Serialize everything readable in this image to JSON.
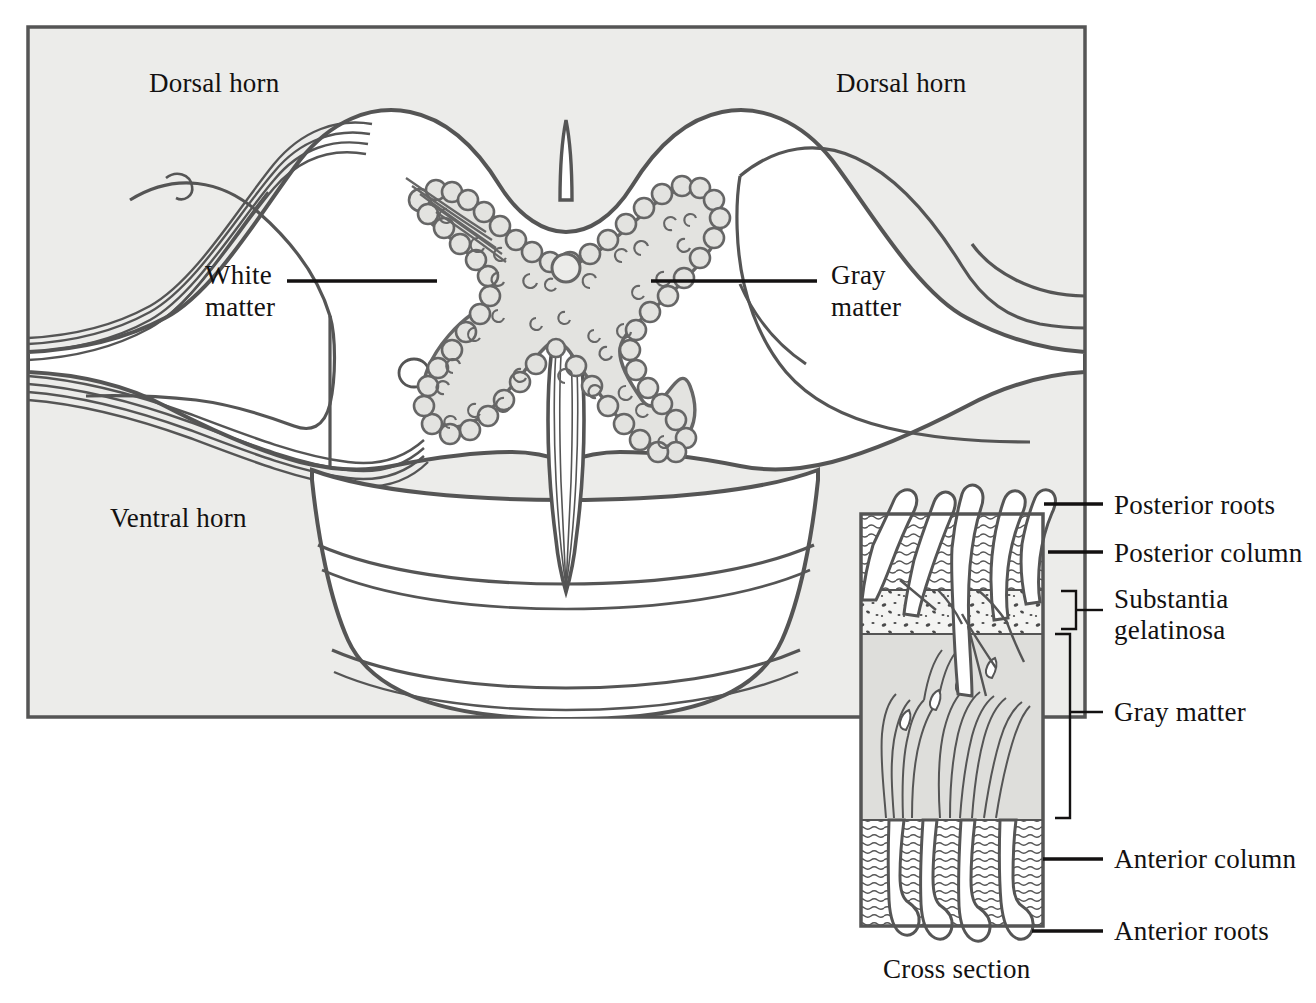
{
  "figure": {
    "kind": "anatomical-diagram",
    "background_color": "#ffffff",
    "panel_fill": "#ececea",
    "gray_matter_fill": "#e3e3e0",
    "ink_color": "#4a4a4a",
    "text_color": "#131111"
  },
  "main_panel": {
    "labels": {
      "dorsal_horn_left": "Dorsal horn",
      "dorsal_horn_right": "Dorsal horn",
      "white_matter_line1": "White",
      "white_matter_line2": "matter",
      "gray_matter_line1": "Gray",
      "gray_matter_line2": "matter",
      "ventral_horn": "Ventral horn"
    }
  },
  "inset": {
    "caption": "Cross section",
    "labels": [
      {
        "id": "posterior-roots",
        "text": "Posterior roots",
        "connector": "line"
      },
      {
        "id": "posterior-column",
        "text": "Posterior column",
        "connector": "line"
      },
      {
        "id": "substantia-gelatinosa",
        "text_line1": "Substantia",
        "text_line2": "gelatinosa",
        "connector": "bracket"
      },
      {
        "id": "gray-matter",
        "text": "Gray matter",
        "connector": "bracket"
      },
      {
        "id": "anterior-column",
        "text": "Anterior column",
        "connector": "line"
      },
      {
        "id": "anterior-roots",
        "text": "Anterior roots",
        "connector": "line"
      }
    ],
    "bands": [
      {
        "id": "posterior-column-band",
        "pattern": "wavy-horizontal-lines"
      },
      {
        "id": "substantia-gelatinosa-band",
        "pattern": "stipple-dots"
      },
      {
        "id": "gray-matter-band",
        "pattern": "solid-gray-with-fibers"
      },
      {
        "id": "anterior-column-band",
        "pattern": "wavy-horizontal-lines"
      }
    ]
  }
}
